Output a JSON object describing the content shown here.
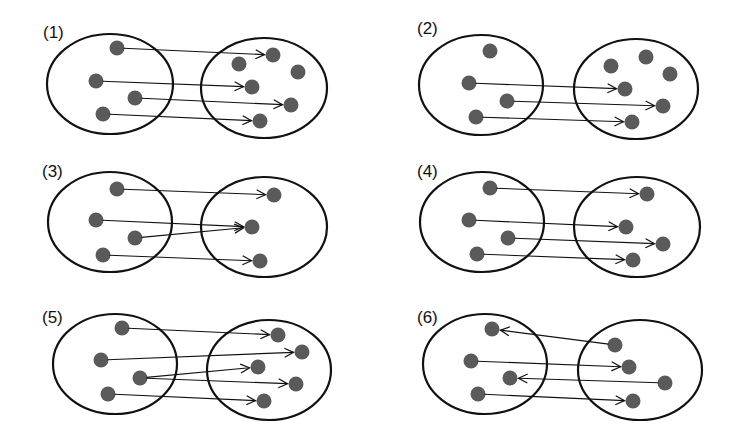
{
  "figure": {
    "colors": {
      "background": "#ffffff",
      "stroke": "#111111",
      "dot": "#5a5a5a"
    },
    "dot_radius": 7.5
  },
  "panels": [
    {
      "label": "(1)",
      "label_pos": [
        43,
        38
      ],
      "left_set": {
        "cx": 110,
        "cy": 84,
        "rx": 63,
        "ry": 50
      },
      "right_set": {
        "cx": 264,
        "cy": 88,
        "rx": 63,
        "ry": 50
      },
      "left_dots": [
        [
          117,
          48
        ],
        [
          96,
          81
        ],
        [
          135,
          98
        ],
        [
          103,
          114
        ]
      ],
      "right_dots": [
        [
          273,
          55
        ],
        [
          239,
          64
        ],
        [
          298,
          72
        ],
        [
          252,
          87
        ],
        [
          291,
          105
        ],
        [
          260,
          121
        ]
      ],
      "arrows": [
        {
          "from": "L0",
          "to": "R0"
        },
        {
          "from": "L1",
          "to": "R3"
        },
        {
          "from": "L2",
          "to": "R4"
        },
        {
          "from": "L3",
          "to": "R5"
        }
      ]
    },
    {
      "label": "(2)",
      "label_pos": [
        417,
        34
      ],
      "left_set": {
        "cx": 481,
        "cy": 85,
        "rx": 62,
        "ry": 50
      },
      "right_set": {
        "cx": 636,
        "cy": 89,
        "rx": 62,
        "ry": 50
      },
      "left_dots": [
        [
          490,
          51
        ],
        [
          469,
          83
        ],
        [
          507,
          101
        ],
        [
          476,
          117
        ]
      ],
      "right_dots": [
        [
          611,
          66
        ],
        [
          646,
          57
        ],
        [
          670,
          74
        ],
        [
          625,
          89
        ],
        [
          663,
          106
        ],
        [
          632,
          122
        ]
      ],
      "arrows": [
        {
          "from": "L1",
          "to": "R3"
        },
        {
          "from": "L2",
          "to": "R4"
        },
        {
          "from": "L3",
          "to": "R5"
        }
      ]
    },
    {
      "label": "(3)",
      "label_pos": [
        42,
        177
      ],
      "left_set": {
        "cx": 110,
        "cy": 222,
        "rx": 62,
        "ry": 50
      },
      "right_set": {
        "cx": 264,
        "cy": 227,
        "rx": 63,
        "ry": 50
      },
      "left_dots": [
        [
          117,
          189
        ],
        [
          96,
          220
        ],
        [
          135,
          238
        ],
        [
          103,
          255
        ]
      ],
      "right_dots": [
        [
          274,
          195
        ],
        [
          252,
          227
        ],
        [
          260,
          261
        ]
      ],
      "arrows": [
        {
          "from": "L0",
          "to": "R0"
        },
        {
          "from": "L1",
          "to": "R1"
        },
        {
          "from": "L2",
          "to": "R1"
        },
        {
          "from": "L3",
          "to": "R2"
        }
      ]
    },
    {
      "label": "(4)",
      "label_pos": [
        417,
        177
      ],
      "left_set": {
        "cx": 482,
        "cy": 222,
        "rx": 62,
        "ry": 50
      },
      "right_set": {
        "cx": 637,
        "cy": 227,
        "rx": 63,
        "ry": 50
      },
      "left_dots": [
        [
          490,
          188
        ],
        [
          469,
          220
        ],
        [
          508,
          238
        ],
        [
          477,
          254
        ]
      ],
      "right_dots": [
        [
          647,
          194
        ],
        [
          626,
          227
        ],
        [
          663,
          244
        ],
        [
          633,
          260
        ]
      ],
      "arrows": [
        {
          "from": "L0",
          "to": "R0"
        },
        {
          "from": "L1",
          "to": "R1"
        },
        {
          "from": "L2",
          "to": "R2"
        },
        {
          "from": "L3",
          "to": "R3"
        }
      ]
    },
    {
      "label": "(5)",
      "label_pos": [
        42,
        323
      ],
      "left_set": {
        "cx": 115,
        "cy": 364,
        "rx": 62,
        "ry": 50
      },
      "right_set": {
        "cx": 269,
        "cy": 370,
        "rx": 62,
        "ry": 50
      },
      "left_dots": [
        [
          122,
          328
        ],
        [
          101,
          360
        ],
        [
          140,
          378
        ],
        [
          108,
          394
        ]
      ],
      "right_dots": [
        [
          278,
          335
        ],
        [
          302,
          352
        ],
        [
          258,
          367
        ],
        [
          296,
          384
        ],
        [
          264,
          401
        ]
      ],
      "arrows": [
        {
          "from": "L0",
          "to": "R0"
        },
        {
          "from": "L1",
          "to": "R1"
        },
        {
          "from": "L2",
          "to": "R2"
        },
        {
          "from": "L2",
          "to": "R3"
        },
        {
          "from": "L3",
          "to": "R4"
        }
      ]
    },
    {
      "label": "(6)",
      "label_pos": [
        417,
        323
      ],
      "left_set": {
        "cx": 485,
        "cy": 364,
        "rx": 62,
        "ry": 50
      },
      "right_set": {
        "cx": 640,
        "cy": 370,
        "rx": 62,
        "ry": 50
      },
      "left_dots": [
        [
          492,
          329
        ],
        [
          471,
          361
        ],
        [
          510,
          378
        ],
        [
          478,
          394
        ]
      ],
      "right_dots": [
        [
          615,
          345
        ],
        [
          629,
          367
        ],
        [
          665,
          383
        ],
        [
          633,
          401
        ]
      ],
      "arrows": [
        {
          "from": "R0",
          "to": "L0"
        },
        {
          "from": "L1",
          "to": "R1"
        },
        {
          "from": "R2",
          "to": "L2"
        },
        {
          "from": "L3",
          "to": "R3"
        }
      ]
    }
  ]
}
